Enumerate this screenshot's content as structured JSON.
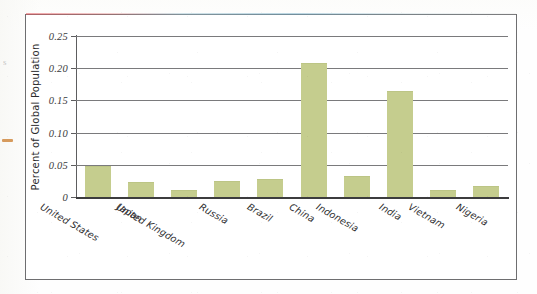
{
  "chart_data": {
    "type": "bar",
    "title": "",
    "xlabel": "",
    "ylabel": "Percent of Global Population",
    "ylim": [
      0,
      0.25
    ],
    "ytick_labels": [
      "0.25",
      "0.20",
      "0.15",
      "0.10",
      "0.05",
      "0"
    ],
    "ytick_values": [
      0.25,
      0.2,
      0.15,
      0.1,
      0.05,
      0
    ],
    "grid": "horizontal",
    "legend": "none",
    "bar_color": "#c5cd8e",
    "categories": [
      "United States",
      "Japan",
      "United Kingdom",
      "Russia",
      "Brazil",
      "China",
      "Indonesia",
      "India",
      "Vietnam",
      "Nigeria"
    ],
    "values": [
      0.047,
      0.021,
      0.009,
      0.023,
      0.026,
      0.206,
      0.031,
      0.163,
      0.009,
      0.016
    ]
  },
  "figure": {
    "frame_color": "#6e6e70",
    "background": "#ffffff"
  },
  "artifacts": {
    "margin_glyph": "s",
    "scan_fringe_colors": [
      "#e45a60",
      "#78afc8"
    ],
    "margin_dash_color": "#d08a42"
  }
}
